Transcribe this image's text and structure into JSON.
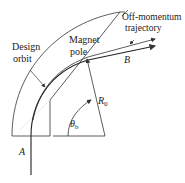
{
  "diagram": {
    "labels": {
      "design_orbit_line1": "Design",
      "design_orbit_line2": "orbit",
      "magnet_pole_line1": "Magnet",
      "magnet_pole_line2": "pole",
      "off_momentum_line1": "Off-momentum",
      "off_momentum_line2": "trajectory",
      "point_a": "A",
      "point_b": "B",
      "radius": "R",
      "radius_sub": "0",
      "angle": "θ",
      "angle_sub": "b"
    },
    "colors": {
      "line": "#333333",
      "text": "#222222",
      "background": "#ffffff"
    }
  }
}
